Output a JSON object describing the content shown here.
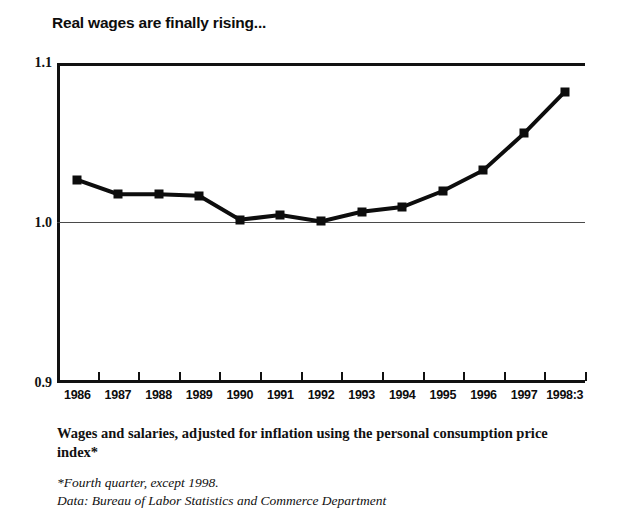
{
  "title": "Real wages are finally rising...",
  "caption": {
    "main": "Wages and salaries, adjusted for inflation using the personal consumption price index*",
    "footnote": "*Fourth quarter, except 1998.",
    "source": "Data: Bureau of Labor Statistics and Commerce Department"
  },
  "axis": {
    "y_ticks": [
      "1.1",
      "1.0",
      "0.9"
    ],
    "y_top_label": "1.1",
    "y_mid_label": "1.0",
    "y_bottom_label": "0.9"
  },
  "colors": {
    "line": "#0d0d0d",
    "marker": "#0d0d0d",
    "frame": "#111111",
    "gridline": "#4a4a4a",
    "background": "#ffffff"
  },
  "chart_data": {
    "type": "line",
    "title": "Real wages are finally rising...",
    "subtitle": "Wages and salaries, adjusted for inflation using the personal consumption price index*",
    "xlabel": "",
    "ylabel": "",
    "ylim": [
      0.9,
      1.1
    ],
    "yticks": [
      0.9,
      1.0,
      1.1
    ],
    "grid": true,
    "legend": "none",
    "categories": [
      "1986",
      "1987",
      "1988",
      "1989",
      "1990",
      "1991",
      "1992",
      "1993",
      "1994",
      "1995",
      "1996",
      "1997",
      "1998:3"
    ],
    "values": [
      1.027,
      1.018,
      1.018,
      1.017,
      1.002,
      1.005,
      1.001,
      1.007,
      1.01,
      1.02,
      1.033,
      1.056,
      1.082
    ],
    "series": [
      {
        "name": "Real wages index",
        "values": [
          1.027,
          1.018,
          1.018,
          1.017,
          1.002,
          1.005,
          1.001,
          1.007,
          1.01,
          1.02,
          1.033,
          1.056,
          1.082
        ]
      }
    ],
    "annotations": [
      "*Fourth quarter, except 1998.",
      "Data: Bureau of Labor Statistics and Commerce Department"
    ]
  }
}
